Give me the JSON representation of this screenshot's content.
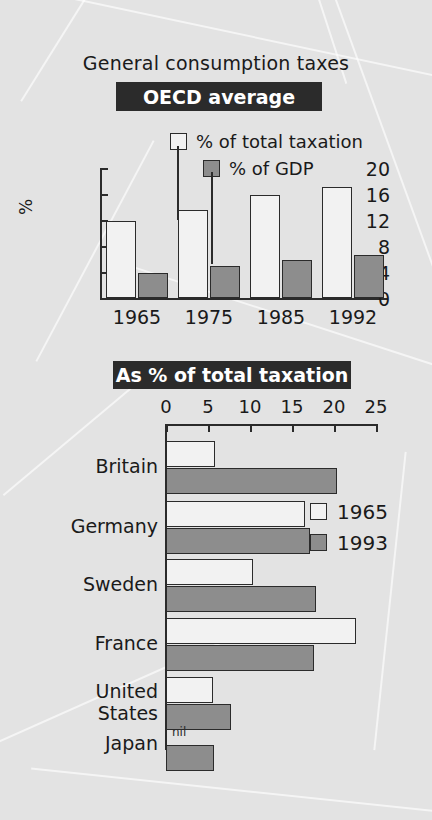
{
  "figure": {
    "top_title": "General consumption taxes",
    "top_banner": "OECD average",
    "bottom_banner": "As % of total taxation"
  },
  "colors": {
    "series_1965": "#f2f2f2",
    "series_1993": "#8d8d8d",
    "banner_bg": "#2b2b2b",
    "banner_text": "#ffffff",
    "background": "#e3e3e3",
    "ink": "#2b2b2b"
  },
  "chart_data": [
    {
      "type": "bar",
      "title": "OECD average",
      "supertitle": "General consumption taxes",
      "xlabel": "",
      "ylabel": "%",
      "ylim": [
        0,
        20
      ],
      "yticks": [
        "0",
        "4",
        "8",
        "12",
        "16",
        "20"
      ],
      "ytick_values": [
        0,
        4,
        8,
        12,
        16,
        20
      ],
      "grid": false,
      "legend_position": "top-right",
      "categories": [
        "1965",
        "1975",
        "1985",
        "1992"
      ],
      "series": [
        {
          "name": "% of total taxation",
          "values": [
            11.9,
            13.5,
            15.8,
            17.1
          ]
        },
        {
          "name": "% of GDP",
          "values": [
            3.9,
            4.9,
            5.9,
            6.6
          ]
        }
      ]
    },
    {
      "type": "bar",
      "orientation": "horizontal",
      "title": "As % of total taxation",
      "xlabel": "",
      "ylabel": "",
      "xlim": [
        0,
        25
      ],
      "xticks": [
        "0",
        "5",
        "10",
        "15",
        "20",
        "25"
      ],
      "xtick_values": [
        0,
        5,
        10,
        15,
        20,
        25
      ],
      "grid": false,
      "legend_position": "right",
      "categories": [
        "Britain",
        "Germany",
        "Sweden",
        "France",
        "United States",
        "Japan"
      ],
      "series": [
        {
          "name": "1965",
          "values": [
            5.8,
            16.5,
            10.3,
            22.6,
            5.6,
            0
          ]
        },
        {
          "name": "1993",
          "values": [
            20.3,
            17.2,
            17.8,
            17.6,
            7.7,
            5.7
          ]
        }
      ],
      "annotations": [
        {
          "category": "Japan",
          "series": "1965",
          "text": "nil"
        }
      ]
    }
  ]
}
